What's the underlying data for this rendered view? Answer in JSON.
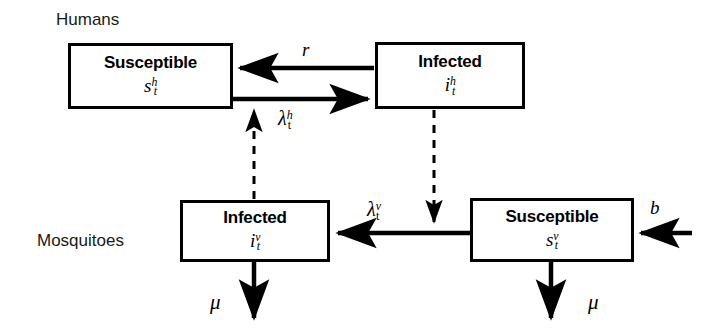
{
  "diagram": {
    "background_color": "#ffffff",
    "stroke_color": "#000000",
    "group_labels": {
      "humans": "Humans",
      "mosquitoes": "Mosquitoes"
    },
    "boxes": {
      "human_susceptible": {
        "title": "Susceptible",
        "symbol_base": "s",
        "symbol_sub": "t",
        "symbol_sup": "h"
      },
      "human_infected": {
        "title": "Infected",
        "symbol_base": "i",
        "symbol_sub": "t",
        "symbol_sup": "h"
      },
      "mosquito_infected": {
        "title": "Infected",
        "symbol_base": "i",
        "symbol_sub": "t",
        "symbol_sup": "v"
      },
      "mosquito_susceptible": {
        "title": "Susceptible",
        "symbol_base": "s",
        "symbol_sub": "t",
        "symbol_sup": "v"
      }
    },
    "edge_labels": {
      "recovery_rate": "r",
      "human_foi_base": "λ",
      "human_foi_sub": "t",
      "human_foi_sup": "h",
      "vector_foi_base": "λ",
      "vector_foi_sub": "t",
      "vector_foi_sup": "v",
      "birth_rate": "b",
      "mortality_left": "μ",
      "mortality_right": "μ"
    }
  }
}
